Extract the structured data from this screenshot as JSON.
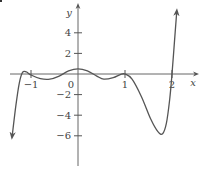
{
  "chart_data": {
    "type": "line",
    "title": "",
    "xlabel": "x",
    "ylabel": "y",
    "xlim": [
      -1.45,
      2.45
    ],
    "ylim": [
      -8,
      7
    ],
    "grid": false,
    "legend": null,
    "x_ticks": [
      -1,
      0,
      1,
      2
    ],
    "x_tick_labels": [
      "−1",
      "0",
      "1",
      "2"
    ],
    "y_ticks": [
      4,
      2,
      -2,
      -4,
      -6
    ],
    "y_tick_labels": [
      "4",
      "2",
      "−2",
      "−4",
      "−6"
    ],
    "series": [
      {
        "name": "f(x)",
        "color": "#555555",
        "arrows": [
          "start-down",
          "end-up"
        ],
        "x": [
          -1.4,
          -1.32,
          -1.25,
          -1.18,
          -1.1,
          -1.0,
          -0.8,
          -0.6,
          -0.4,
          -0.2,
          0.0,
          0.2,
          0.4,
          0.55,
          0.75,
          0.9,
          1.0,
          1.15,
          1.35,
          1.55,
          1.7,
          1.8,
          1.88,
          1.95,
          2.0,
          2.05,
          2.1
        ],
        "y": [
          -6.0,
          -3.0,
          -0.9,
          0.15,
          0.2,
          -0.1,
          -0.45,
          -0.5,
          -0.2,
          0.3,
          0.5,
          0.3,
          -0.2,
          -0.5,
          -0.35,
          -0.05,
          0.0,
          -0.5,
          -2.2,
          -4.4,
          -5.6,
          -5.8,
          -4.8,
          -2.5,
          0.0,
          3.0,
          6.0
        ]
      }
    ],
    "annotations": []
  },
  "axes": {
    "x_label": "x",
    "y_label": "y",
    "origin_label": "0"
  }
}
